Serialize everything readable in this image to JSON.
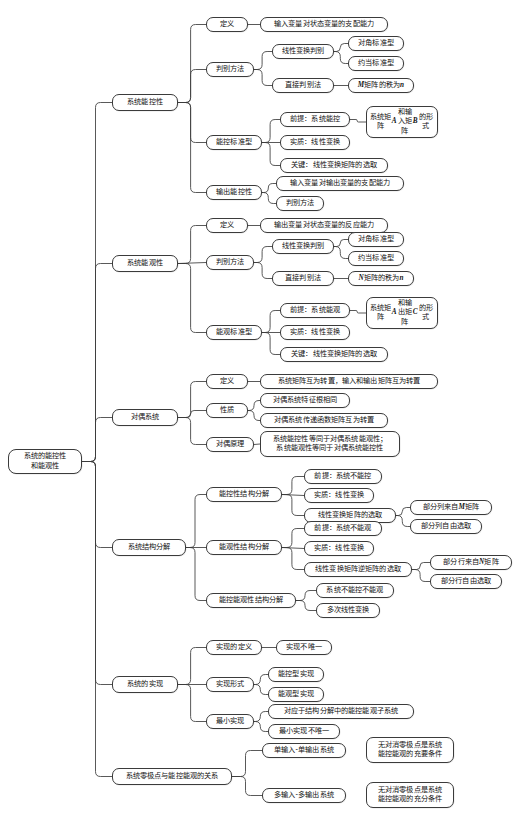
{
  "diagram": {
    "type": "mind-map",
    "orientation": "left-to-right",
    "background_color": "#ffffff",
    "node_border_color": "#3b3b3b",
    "node_fill_color": "#ffffff",
    "text_color": "#111111"
  },
  "root": {
    "label": "系统的能控性\n和能观性"
  },
  "branches": [
    {
      "label": "系统能控性",
      "children": [
        {
          "label": "定义",
          "children": [
            {
              "label": "输入变量对状态变量的支配能力"
            }
          ]
        },
        {
          "label": "判别方法",
          "children": [
            {
              "label": "线性变换判别",
              "children": [
                {
                  "label": "对角标准型"
                },
                {
                  "label": "约当标准型"
                }
              ]
            },
            {
              "label": "直接判别法",
              "children": [
                {
                  "label": "M 矩阵的秩为 n"
                }
              ]
            }
          ]
        },
        {
          "label": "能控标准型",
          "children": [
            {
              "label": "前提：系统能控",
              "children": [
                {
                  "label": "系统矩阵 A 和输\n入矩阵 B 的形式"
                }
              ]
            },
            {
              "label": "实质：线性变换"
            },
            {
              "label": "关键：线性变换矩阵的选取"
            }
          ]
        },
        {
          "label": "输出能控性",
          "children": [
            {
              "label": "输入变量对输出变量的支配能力"
            },
            {
              "label": "判别方法"
            }
          ]
        }
      ]
    },
    {
      "label": "系统能观性",
      "children": [
        {
          "label": "定义",
          "children": [
            {
              "label": "输出变量对状态变量的反应能力"
            }
          ]
        },
        {
          "label": "判别方法",
          "children": [
            {
              "label": "线性变换判别",
              "children": [
                {
                  "label": "对角标准型"
                },
                {
                  "label": "约当标准型"
                }
              ]
            },
            {
              "label": "直接判别法",
              "children": [
                {
                  "label": "N 矩阵的秩为 n"
                }
              ]
            }
          ]
        },
        {
          "label": "能观标准型",
          "children": [
            {
              "label": "前提：系统能观",
              "children": [
                {
                  "label": "系统矩阵 A 和输\n出矩阵 C 的形式"
                }
              ]
            },
            {
              "label": "实质：线性变换"
            },
            {
              "label": "关键：线性变换矩阵的选取"
            }
          ]
        }
      ]
    },
    {
      "label": "对偶系统",
      "children": [
        {
          "label": "定义",
          "children": [
            {
              "label": "系统矩阵互为转置，输入和输出矩阵互为转置"
            }
          ]
        },
        {
          "label": "性质",
          "children": [
            {
              "label": "对偶系统特征根相同"
            },
            {
              "label": "对偶系统传递函数矩阵互为转置"
            }
          ]
        },
        {
          "label": "对偶原理",
          "children": [
            {
              "label": "系统能控性等同于对偶系统能观性；\n系统能观性等同于对偶系统能控性"
            }
          ]
        }
      ]
    },
    {
      "label": "系统结构分解",
      "children": [
        {
          "label": "能控性结构分解",
          "children": [
            {
              "label": "前提：系统不能控"
            },
            {
              "label": "实质：线性变换"
            },
            {
              "label": "线性变换矩阵的选取",
              "children": [
                {
                  "label": "部分列来自 M 矩阵"
                },
                {
                  "label": "部分列自由选取"
                }
              ]
            }
          ]
        },
        {
          "label": "能观性结构分解",
          "children": [
            {
              "label": "前提：系统不能观"
            },
            {
              "label": "实质：线性变换"
            },
            {
              "label": "线性变换矩阵逆矩阵的选取",
              "children": [
                {
                  "label": "部分行来自 N 矩阵"
                },
                {
                  "label": "部分行自由选取"
                }
              ]
            }
          ]
        },
        {
          "label": "能控能观性结构分解",
          "children": [
            {
              "label": "系统不能控不能观"
            },
            {
              "label": "多次线性变换"
            }
          ]
        }
      ]
    },
    {
      "label": "系统的实现",
      "children": [
        {
          "label": "实现的定义",
          "children": [
            {
              "label": "实现不唯一"
            }
          ]
        },
        {
          "label": "实现形式",
          "children": [
            {
              "label": "能控型实现"
            },
            {
              "label": "能观型实现"
            }
          ]
        },
        {
          "label": "最小实现",
          "children": [
            {
              "label": "对应于结构分解中的能控能观子系统"
            },
            {
              "label": "最小实现不唯一"
            }
          ]
        }
      ]
    },
    {
      "label": "系统零极点与能控能观的关系",
      "children": [
        {
          "label": "单输入-单输出系统",
          "children": [
            {
              "label": "无对消零极点是系统\n能控能观的充要条件"
            }
          ]
        },
        {
          "label": "多输入-多输出系统",
          "children": [
            {
              "label": "无对消零极点是系统\n能控能观的充分条件"
            }
          ]
        }
      ]
    }
  ],
  "nodes": [
    {
      "id": "root",
      "label": "系统的能控性\n和能观性",
      "x": 8,
      "y": 449,
      "w": 74,
      "h": 25
    },
    {
      "id": "b1",
      "label": "系统能控性",
      "x": 112,
      "y": 94,
      "w": 66,
      "h": 17
    },
    {
      "id": "b1c1",
      "label": "定义",
      "x": 206,
      "y": 17,
      "w": 42,
      "h": 15
    },
    {
      "id": "b1c1g1",
      "label": "输入变量对状态变量的支配能力",
      "x": 260,
      "y": 17,
      "w": 128,
      "h": 15
    },
    {
      "id": "b1c2",
      "label": "判别方法",
      "x": 206,
      "y": 62,
      "w": 48,
      "h": 15
    },
    {
      "id": "b1c2g1",
      "label": "线性变换判别",
      "x": 272,
      "y": 44,
      "w": 62,
      "h": 15
    },
    {
      "id": "b1c2g1h1",
      "label": "对角标准型",
      "x": 348,
      "y": 36,
      "w": 56,
      "h": 15
    },
    {
      "id": "b1c2g1h2",
      "label": "约当标准型",
      "x": 348,
      "y": 56,
      "w": 56,
      "h": 15
    },
    {
      "id": "b1c2g2",
      "label": "直接判别法",
      "x": 272,
      "y": 78,
      "w": 62,
      "h": 15
    },
    {
      "id": "b1c2g2h1",
      "label": "M 矩阵的秩为 n",
      "x": 348,
      "y": 78,
      "w": 66,
      "h": 15
    },
    {
      "id": "b1c3",
      "label": "能控标准型",
      "x": 206,
      "y": 135,
      "w": 56,
      "h": 15
    },
    {
      "id": "b1c3g1",
      "label": "前提：系统能控",
      "x": 280,
      "y": 112,
      "w": 70,
      "h": 15
    },
    {
      "id": "b1c3g1h1",
      "label": "系统矩阵 A 和输\n入矩阵 B 的形式",
      "x": 366,
      "y": 106,
      "w": 72,
      "h": 26
    },
    {
      "id": "b1c3g2",
      "label": "实质：线性变换",
      "x": 280,
      "y": 135,
      "w": 70,
      "h": 15
    },
    {
      "id": "b1c3g3",
      "label": "关键：线性变换矩阵的选取",
      "x": 280,
      "y": 158,
      "w": 108,
      "h": 15
    },
    {
      "id": "b1c4",
      "label": "输出能控性",
      "x": 206,
      "y": 185,
      "w": 56,
      "h": 15
    },
    {
      "id": "b1c4g1",
      "label": "输入变量对输出变量的支配能力",
      "x": 276,
      "y": 176,
      "w": 128,
      "h": 15
    },
    {
      "id": "b1c4g2",
      "label": "判别方法",
      "x": 276,
      "y": 196,
      "w": 48,
      "h": 15
    },
    {
      "id": "b2",
      "label": "系统能观性",
      "x": 112,
      "y": 255,
      "w": 66,
      "h": 17
    },
    {
      "id": "b2c1",
      "label": "定义",
      "x": 206,
      "y": 218,
      "w": 42,
      "h": 15
    },
    {
      "id": "b2c1g1",
      "label": "输出变量对状态变量的反应能力",
      "x": 260,
      "y": 218,
      "w": 128,
      "h": 15
    },
    {
      "id": "b2c2",
      "label": "判别方法",
      "x": 206,
      "y": 255,
      "w": 48,
      "h": 15
    },
    {
      "id": "b2c2g1",
      "label": "线性变换判别",
      "x": 272,
      "y": 239,
      "w": 62,
      "h": 15
    },
    {
      "id": "b2c2g1h1",
      "label": "对角标准型",
      "x": 348,
      "y": 232,
      "w": 56,
      "h": 15
    },
    {
      "id": "b2c2g1h2",
      "label": "约当标准型",
      "x": 348,
      "y": 251,
      "w": 56,
      "h": 15
    },
    {
      "id": "b2c2g2",
      "label": "直接判别法",
      "x": 272,
      "y": 271,
      "w": 62,
      "h": 15
    },
    {
      "id": "b2c2g2h1",
      "label": "N 矩阵的秩为 n",
      "x": 348,
      "y": 271,
      "w": 66,
      "h": 15
    },
    {
      "id": "b2c3",
      "label": "能观标准型",
      "x": 206,
      "y": 325,
      "w": 56,
      "h": 15
    },
    {
      "id": "b2c3g1",
      "label": "前提：系统能观",
      "x": 280,
      "y": 303,
      "w": 70,
      "h": 15
    },
    {
      "id": "b2c3g1h1",
      "label": "系统矩阵 A 和输\n出矩阵 C 的形式",
      "x": 366,
      "y": 297,
      "w": 72,
      "h": 26
    },
    {
      "id": "b2c3g2",
      "label": "实质：线性变换",
      "x": 280,
      "y": 325,
      "w": 70,
      "h": 15
    },
    {
      "id": "b2c3g3",
      "label": "关键：线性变换矩阵的选取",
      "x": 280,
      "y": 347,
      "w": 108,
      "h": 15
    },
    {
      "id": "b3",
      "label": "对偶系统",
      "x": 112,
      "y": 409,
      "w": 66,
      "h": 17
    },
    {
      "id": "b3c1",
      "label": "定义",
      "x": 206,
      "y": 374,
      "w": 42,
      "h": 15
    },
    {
      "id": "b3c1g1",
      "label": "系统矩阵互为转置，输入和输出矩阵互为转置",
      "x": 260,
      "y": 374,
      "w": 178,
      "h": 15
    },
    {
      "id": "b3c2",
      "label": "性质",
      "x": 206,
      "y": 403,
      "w": 42,
      "h": 15
    },
    {
      "id": "b3c2g1",
      "label": "对偶系统特征根相同",
      "x": 260,
      "y": 393,
      "w": 90,
      "h": 15
    },
    {
      "id": "b3c2g2",
      "label": "对偶系统传递函数矩阵互为转置",
      "x": 260,
      "y": 413,
      "w": 128,
      "h": 15
    },
    {
      "id": "b3c3",
      "label": "对偶原理",
      "x": 206,
      "y": 437,
      "w": 48,
      "h": 15
    },
    {
      "id": "b3c3g1",
      "label": "系统能控性等同于对偶系统能观性；\n系统能观性等同于对偶系统能控性",
      "x": 260,
      "y": 431,
      "w": 140,
      "h": 26
    },
    {
      "id": "b4",
      "label": "系统结构分解",
      "x": 112,
      "y": 539,
      "w": 74,
      "h": 17
    },
    {
      "id": "b4c1",
      "label": "能控性结构分解",
      "x": 206,
      "y": 487,
      "w": 76,
      "h": 15
    },
    {
      "id": "b4c1g1",
      "label": "前提：系统不能控",
      "x": 304,
      "y": 469,
      "w": 78,
      "h": 15
    },
    {
      "id": "b4c1g2",
      "label": "实质：线性变换",
      "x": 304,
      "y": 488,
      "w": 70,
      "h": 15
    },
    {
      "id": "b4c1g3",
      "label": "线性变换矩阵的选取",
      "x": 304,
      "y": 508,
      "w": 92,
      "h": 15
    },
    {
      "id": "b4c1g3h1",
      "label": "部分列来自 M 矩阵",
      "x": 410,
      "y": 500,
      "w": 82,
      "h": 15
    },
    {
      "id": "b4c1g3h2",
      "label": "部分列自由选取",
      "x": 410,
      "y": 519,
      "w": 72,
      "h": 15
    },
    {
      "id": "b4c2",
      "label": "能观性结构分解",
      "x": 206,
      "y": 540,
      "w": 76,
      "h": 15
    },
    {
      "id": "b4c2g1",
      "label": "前提：系统不能观",
      "x": 304,
      "y": 521,
      "w": 78,
      "h": 15
    },
    {
      "id": "b4c2g2",
      "label": "实质：线性变换",
      "x": 304,
      "y": 541,
      "w": 70,
      "h": 15
    },
    {
      "id": "b4c2g3",
      "label": "线性变换矩阵逆矩阵的选取",
      "x": 304,
      "y": 562,
      "w": 108,
      "h": 15
    },
    {
      "id": "b4c2g3h1",
      "label": "部分行来自 N 矩阵",
      "x": 430,
      "y": 555,
      "w": 82,
      "h": 15
    },
    {
      "id": "b4c2g3h2",
      "label": "部分行自由选取",
      "x": 430,
      "y": 574,
      "w": 72,
      "h": 15
    },
    {
      "id": "b4c3",
      "label": "能控能观性结构分解",
      "x": 206,
      "y": 593,
      "w": 90,
      "h": 15
    },
    {
      "id": "b4c3g1",
      "label": "系统不能控不能观",
      "x": 316,
      "y": 583,
      "w": 78,
      "h": 15
    },
    {
      "id": "b4c3g2",
      "label": "多次线性变换",
      "x": 316,
      "y": 603,
      "w": 64,
      "h": 15
    },
    {
      "id": "b5",
      "label": "系统的实现",
      "x": 112,
      "y": 676,
      "w": 66,
      "h": 17
    },
    {
      "id": "b5c1",
      "label": "实现的定义",
      "x": 206,
      "y": 640,
      "w": 56,
      "h": 15
    },
    {
      "id": "b5c1g1",
      "label": "实现不唯一",
      "x": 276,
      "y": 640,
      "w": 56,
      "h": 15
    },
    {
      "id": "b5c2",
      "label": "实现形式",
      "x": 206,
      "y": 677,
      "w": 48,
      "h": 15
    },
    {
      "id": "b5c2g1",
      "label": "能控型实现",
      "x": 268,
      "y": 667,
      "w": 56,
      "h": 15
    },
    {
      "id": "b5c2g2",
      "label": "能观型实现",
      "x": 268,
      "y": 687,
      "w": 56,
      "h": 15
    },
    {
      "id": "b5c3",
      "label": "最小实现",
      "x": 206,
      "y": 714,
      "w": 48,
      "h": 15
    },
    {
      "id": "b5c3g1",
      "label": "对应于结构分解中的能控能观子系统",
      "x": 268,
      "y": 704,
      "w": 146,
      "h": 15
    },
    {
      "id": "b5c3g2",
      "label": "最小实现不唯一",
      "x": 268,
      "y": 724,
      "w": 72,
      "h": 15
    },
    {
      "id": "b6",
      "label": "系统零极点与能控能观的关系",
      "x": 112,
      "y": 768,
      "w": 120,
      "h": 17
    },
    {
      "id": "b6c1",
      "label": "单输入-单输出系统",
      "x": 262,
      "y": 743,
      "w": 84,
      "h": 15
    },
    {
      "id": "b6c1g1",
      "label": "无对消零极点是系统\n能控能观的充要条件",
      "x": 366,
      "y": 737,
      "w": 88,
      "h": 26
    },
    {
      "id": "b6c2",
      "label": "多输入-多输出系统",
      "x": 262,
      "y": 788,
      "w": 84,
      "h": 15
    },
    {
      "id": "b6c2g1",
      "label": "无对消零极点是系统\n能控能观的充分条件",
      "x": 366,
      "y": 782,
      "w": 88,
      "h": 26
    }
  ],
  "edges": [
    {
      "from": "root",
      "to": "b1"
    },
    {
      "from": "root",
      "to": "b2"
    },
    {
      "from": "root",
      "to": "b3"
    },
    {
      "from": "root",
      "to": "b4"
    },
    {
      "from": "root",
      "to": "b5"
    },
    {
      "from": "root",
      "to": "b6"
    },
    {
      "from": "b1",
      "to": "b1c1"
    },
    {
      "from": "b1",
      "to": "b1c2"
    },
    {
      "from": "b1",
      "to": "b1c3"
    },
    {
      "from": "b1",
      "to": "b1c4"
    },
    {
      "from": "b1c1",
      "to": "b1c1g1"
    },
    {
      "from": "b1c2",
      "to": "b1c2g1"
    },
    {
      "from": "b1c2",
      "to": "b1c2g2"
    },
    {
      "from": "b1c2g1",
      "to": "b1c2g1h1"
    },
    {
      "from": "b1c2g1",
      "to": "b1c2g1h2"
    },
    {
      "from": "b1c2g2",
      "to": "b1c2g2h1"
    },
    {
      "from": "b1c3",
      "to": "b1c3g1"
    },
    {
      "from": "b1c3",
      "to": "b1c3g2"
    },
    {
      "from": "b1c3",
      "to": "b1c3g3"
    },
    {
      "from": "b1c3g1",
      "to": "b1c3g1h1"
    },
    {
      "from": "b1c4",
      "to": "b1c4g1"
    },
    {
      "from": "b1c4",
      "to": "b1c4g2"
    },
    {
      "from": "b2",
      "to": "b2c1"
    },
    {
      "from": "b2",
      "to": "b2c2"
    },
    {
      "from": "b2",
      "to": "b2c3"
    },
    {
      "from": "b2c1",
      "to": "b2c1g1"
    },
    {
      "from": "b2c2",
      "to": "b2c2g1"
    },
    {
      "from": "b2c2",
      "to": "b2c2g2"
    },
    {
      "from": "b2c2g1",
      "to": "b2c2g1h1"
    },
    {
      "from": "b2c2g1",
      "to": "b2c2g1h2"
    },
    {
      "from": "b2c2g2",
      "to": "b2c2g2h1"
    },
    {
      "from": "b2c3",
      "to": "b2c3g1"
    },
    {
      "from": "b2c3",
      "to": "b2c3g2"
    },
    {
      "from": "b2c3",
      "to": "b2c3g3"
    },
    {
      "from": "b2c3g1",
      "to": "b2c3g1h1"
    },
    {
      "from": "b3",
      "to": "b3c1"
    },
    {
      "from": "b3",
      "to": "b3c2"
    },
    {
      "from": "b3",
      "to": "b3c3"
    },
    {
      "from": "b3c1",
      "to": "b3c1g1"
    },
    {
      "from": "b3c2",
      "to": "b3c2g1"
    },
    {
      "from": "b3c2",
      "to": "b3c2g2"
    },
    {
      "from": "b3c3",
      "to": "b3c3g1"
    },
    {
      "from": "b4",
      "to": "b4c1"
    },
    {
      "from": "b4",
      "to": "b4c2"
    },
    {
      "from": "b4",
      "to": "b4c3"
    },
    {
      "from": "b4c1",
      "to": "b4c1g1"
    },
    {
      "from": "b4c1",
      "to": "b4c1g2"
    },
    {
      "from": "b4c1",
      "to": "b4c1g3"
    },
    {
      "from": "b4c1g3",
      "to": "b4c1g3h1"
    },
    {
      "from": "b4c1g3",
      "to": "b4c1g3h2"
    },
    {
      "from": "b4c2",
      "to": "b4c2g1"
    },
    {
      "from": "b4c2",
      "to": "b4c2g2"
    },
    {
      "from": "b4c2",
      "to": "b4c2g3"
    },
    {
      "from": "b4c2g3",
      "to": "b4c2g3h1"
    },
    {
      "from": "b4c2g3",
      "to": "b4c2g3h2"
    },
    {
      "from": "b4c3",
      "to": "b4c3g1"
    },
    {
      "from": "b4c3",
      "to": "b4c3g2"
    },
    {
      "from": "b5",
      "to": "b5c1"
    },
    {
      "from": "b5",
      "to": "b5c2"
    },
    {
      "from": "b5",
      "to": "b5c3"
    },
    {
      "from": "b5c1",
      "to": "b5c1g1"
    },
    {
      "from": "b5c2",
      "to": "b5c2g1"
    },
    {
      "from": "b5c2",
      "to": "b5c2g2"
    },
    {
      "from": "b5c3",
      "to": "b5c3g1"
    },
    {
      "from": "b5c3",
      "to": "b5c3g2"
    },
    {
      "from": "b6",
      "to": "b6c1"
    },
    {
      "from": "b6",
      "to": "b6c2"
    }
  ]
}
